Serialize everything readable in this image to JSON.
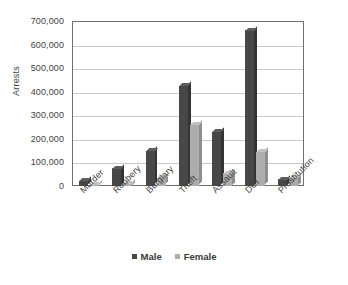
{
  "chart_data": {
    "type": "bar",
    "title": "",
    "xlabel": "",
    "ylabel": "Arrests",
    "ylim": [
      0,
      700000
    ],
    "ytick_step": 100000,
    "grid": true,
    "legend_position": "bottom",
    "categories": [
      "Murder",
      "Robbery",
      "Burglary",
      "Theft",
      "Assault",
      "DUI",
      "Prostitution"
    ],
    "series": [
      {
        "name": "Male",
        "color": "#474747",
        "values": [
          22000,
          75000,
          150000,
          425000,
          230000,
          660000,
          30000
        ]
      },
      {
        "name": "Female",
        "color": "#adadad",
        "values": [
          4000,
          13000,
          35000,
          260000,
          55000,
          145000,
          38000
        ]
      }
    ],
    "ytick_labels": [
      "0",
      "100,000",
      "200,000",
      "300,000",
      "400,000",
      "500,000",
      "600,000",
      "700,000"
    ],
    "ytick_values": [
      0,
      100000,
      200000,
      300000,
      400000,
      500000,
      600000,
      700000
    ]
  },
  "axis": {
    "y_title": "Arrests"
  },
  "legend": {
    "items": [
      {
        "label": "Male",
        "swatch": "male-legend-swatch"
      },
      {
        "label": "Female",
        "swatch": "female-legend-swatch"
      }
    ]
  }
}
